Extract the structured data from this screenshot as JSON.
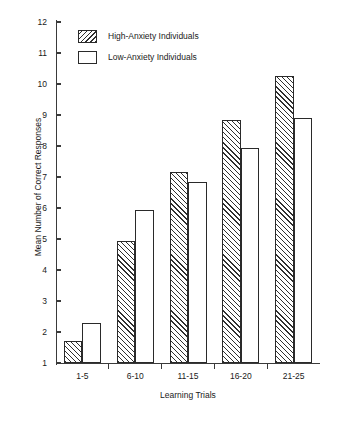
{
  "chart_data": {
    "type": "bar",
    "title": "",
    "xlabel": "Learning Trials",
    "ylabel": "Mean Number of Correct Responses",
    "categories": [
      "1-5",
      "6-10",
      "11-15",
      "16-20",
      "21-25"
    ],
    "series": [
      {
        "name": "High-Anxiety Individuals",
        "fill": "diagonal-hatch",
        "values": [
          1.7,
          4.95,
          7.15,
          8.85,
          10.25
        ]
      },
      {
        "name": "Low-Anxiety Individuals",
        "fill": "white",
        "values": [
          2.3,
          5.95,
          6.85,
          7.95,
          8.9
        ]
      }
    ],
    "ylim": [
      1,
      12
    ],
    "y_ticks": [
      1,
      2,
      3,
      4,
      5,
      6,
      7,
      8,
      9,
      10,
      11,
      12
    ],
    "y_tick_labels": [
      "1",
      "2",
      "3",
      "4",
      "5",
      "6",
      "7",
      "8",
      "9",
      "10",
      "11",
      "12"
    ],
    "grid": false,
    "legend_position": "upper-left-inside",
    "axis_color": "#3a3a3a",
    "bar_outline_color": "#2a2a2a",
    "hatch_color": "#2f2f2f",
    "background_color": "#ffffff"
  },
  "legend": {
    "entries": [
      {
        "label": "High-Anxiety Individuals",
        "swatch": "hatched-swatch"
      },
      {
        "label": "Low-Anxiety Individuals",
        "swatch": "empty-swatch"
      }
    ]
  }
}
